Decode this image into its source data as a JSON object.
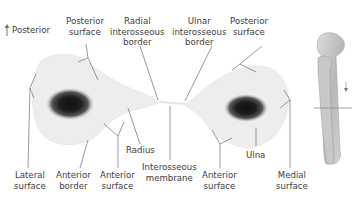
{
  "orientation": {
    "arrow_label": "Posterior"
  },
  "labels": {
    "posterior_surface_radius": [
      "Posterior",
      "surface"
    ],
    "radial_interosseous_border": [
      "Radial",
      "interosseous",
      "border"
    ],
    "ulnar_interosseous_border": [
      "Ulnar",
      "interosseous",
      "border"
    ],
    "posterior_surface_ulna": [
      "Posterior",
      "surface"
    ],
    "radius": "Radius",
    "interosseous_membrane": [
      "Interosseous",
      "membrane"
    ],
    "lateral_surface": [
      "Lateral",
      "surface"
    ],
    "anterior_border": [
      "Anterior",
      "border"
    ],
    "anterior_surface_radius": [
      "Anterior",
      "surface"
    ],
    "anterior_surface_ulna": [
      "Anterior",
      "surface"
    ],
    "ulna": "Ulna",
    "medial_surface": [
      "Medial",
      "surface"
    ]
  },
  "colors": {
    "bone_fill": "#ececec",
    "marrow": "#1a1a1a",
    "leader_line": "#555555",
    "section_line": "#8a8a8a"
  }
}
